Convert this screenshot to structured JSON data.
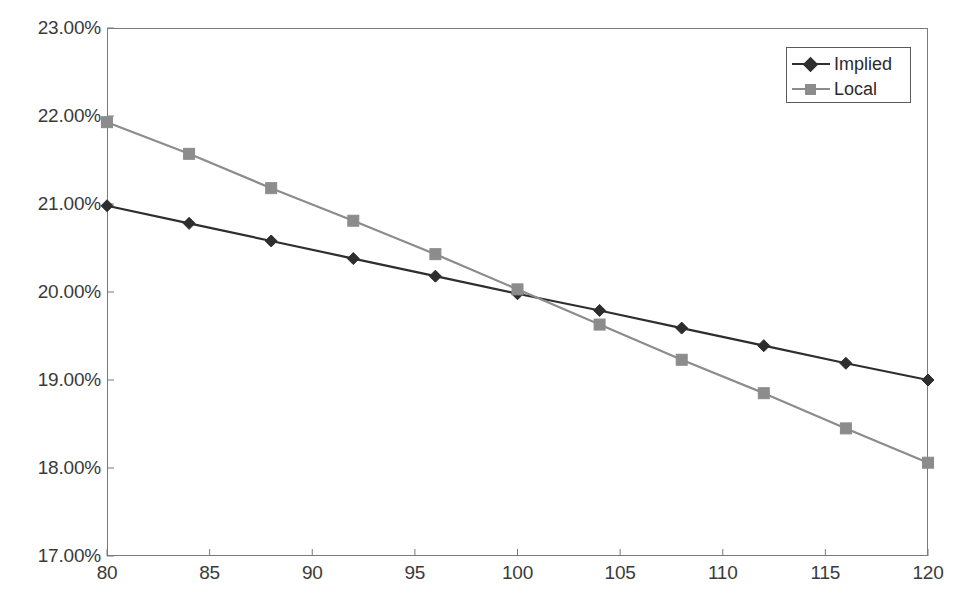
{
  "chart_data": {
    "type": "line",
    "title": "",
    "subtitle": "",
    "xlabel": "",
    "ylabel": "",
    "xlim": [
      80,
      120
    ],
    "ylim": [
      0.17,
      0.23
    ],
    "grid": false,
    "legend_position": "top-right",
    "x": [
      80,
      84,
      88,
      92,
      96,
      100,
      104,
      108,
      112,
      116,
      120
    ],
    "x_tick_values": [
      80,
      85,
      90,
      95,
      100,
      105,
      110,
      115,
      120
    ],
    "x_tick_labels": [
      "80",
      "85",
      "90",
      "95",
      "100",
      "105",
      "110",
      "115",
      "120"
    ],
    "y_tick_values": [
      0.17,
      0.18,
      0.19,
      0.2,
      0.21,
      0.22,
      0.23
    ],
    "y_tick_labels": [
      "17.00%",
      "18.00%",
      "19.00%",
      "20.00%",
      "21.00%",
      "22.00%",
      "23.00%"
    ],
    "series": [
      {
        "name": "Implied",
        "color": "#2e2e2e",
        "marker": "diamond",
        "values": [
          0.2098,
          0.2078,
          0.2058,
          0.2038,
          0.2018,
          0.1998,
          0.1979,
          0.1959,
          0.1939,
          0.1919,
          0.19
        ],
        "value_labels": [
          "20.98%",
          "20.78%",
          "20.58%",
          "20.38%",
          "20.18%",
          "19.98%",
          "19.79%",
          "19.59%",
          "19.39%",
          "19.19%",
          "19.00%"
        ]
      },
      {
        "name": "Local",
        "color": "#8c8c8c",
        "marker": "square",
        "values": [
          0.2193,
          0.2157,
          0.2118,
          0.2081,
          0.2043,
          0.2003,
          0.1963,
          0.1923,
          0.1885,
          0.1845,
          0.1806
        ],
        "value_labels": [
          "21.93%",
          "21.57%",
          "21.18%",
          "20.81%",
          "20.43%",
          "20.03%",
          "19.63%",
          "19.23%",
          "18.85%",
          "18.45%",
          "18.06%"
        ]
      }
    ]
  },
  "legend": {
    "entries": [
      {
        "label": "Implied"
      },
      {
        "label": "Local"
      }
    ]
  },
  "colors": {
    "implied": "#2e2e2e",
    "local": "#8c8c8c",
    "axis": "#7a7a7a",
    "text": "#3a3a3a",
    "background": "#ffffff"
  }
}
